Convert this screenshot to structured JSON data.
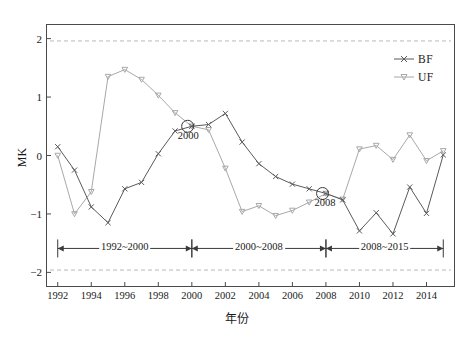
{
  "chart_data": {
    "type": "line",
    "title": "",
    "xlabel": "年份",
    "ylabel": "MK",
    "xlim": [
      1991.3,
      2015.7
    ],
    "ylim": [
      -2.25,
      2.25
    ],
    "xticks": [
      1992,
      1994,
      1996,
      1998,
      2000,
      2002,
      2004,
      2006,
      2008,
      2010,
      2012,
      2014
    ],
    "yticks": [
      2,
      1,
      0,
      -1,
      -2
    ],
    "grid": false,
    "legend_position": "top-right",
    "x": [
      1992,
      1993,
      1994,
      1995,
      1996,
      1997,
      1998,
      1999,
      2000,
      2001,
      2002,
      2003,
      2004,
      2005,
      2006,
      2007,
      2008,
      2009,
      2010,
      2011,
      2012,
      2013,
      2014,
      2015
    ],
    "series": [
      {
        "name": "BF",
        "marker": "x",
        "color": "#5a5a5a",
        "values": [
          0.15,
          -0.25,
          -0.88,
          -1.15,
          -0.57,
          -0.46,
          0.03,
          0.42,
          0.5,
          0.53,
          0.72,
          0.23,
          -0.14,
          -0.36,
          -0.49,
          -0.57,
          -0.65,
          -0.76,
          -1.29,
          -0.98,
          -1.34,
          -0.54,
          -0.99,
          0.01
        ]
      },
      {
        "name": "UF",
        "marker": "triangle-down",
        "color": "#a8a8a8",
        "values": [
          0.0,
          -1.0,
          -0.62,
          1.35,
          1.47,
          1.3,
          1.03,
          0.73,
          0.5,
          0.44,
          -0.22,
          -0.96,
          -0.86,
          -1.03,
          -0.94,
          -0.8,
          -0.65,
          -0.75,
          0.11,
          0.17,
          -0.07,
          0.35,
          -0.09,
          0.08
        ]
      }
    ],
    "significance_lines": {
      "label": "",
      "upper": 1.96,
      "lower": -1.96,
      "style": "dashed",
      "color": "#b9b9b9"
    },
    "intersections": [
      {
        "label": "2000",
        "x": 1999.75,
        "y": 0.5
      },
      {
        "label": "2008",
        "x": 2007.8,
        "y": -0.65
      }
    ],
    "periods": [
      {
        "label": "1992~2000",
        "start": 1992,
        "end": 2000
      },
      {
        "label": "2000~2008",
        "start": 2000,
        "end": 2008
      },
      {
        "label": "2008~2015",
        "start": 2008,
        "end": 2015
      }
    ],
    "period_axis_y": -1.59
  },
  "axis": {
    "y_title": "MK",
    "x_title": "年份",
    "ytick_labels": [
      "2",
      "1",
      "0",
      "−1",
      "−2"
    ],
    "xtick_labels": [
      "1992",
      "1994",
      "1996",
      "1998",
      "2000",
      "2002",
      "2004",
      "2006",
      "2008",
      "2010",
      "2012",
      "2014"
    ]
  },
  "legend": {
    "items": [
      {
        "label": "BF"
      },
      {
        "label": "UF"
      }
    ]
  },
  "annotations": {
    "cross_2000": "2000",
    "cross_2008": "2008",
    "period_0": "1992~2000",
    "period_1": "2000~2008",
    "period_2": "2008~2015"
  }
}
